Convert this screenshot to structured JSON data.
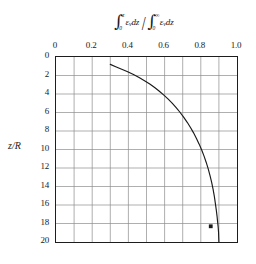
{
  "chart_data": {
    "type": "line",
    "xlabel": "∫₀ᶻ ε_ν dz / ∫₀^∞ ε_ν dz",
    "ylabel": "z/R",
    "xlim": [
      0,
      1.0
    ],
    "ylim": [
      20,
      0
    ],
    "y_inverted": true,
    "grid": true,
    "grid_x_step": 0.1,
    "grid_y_step": 2,
    "xticks": [
      "0",
      "0.2",
      "0.4",
      "0.6",
      "0.8",
      "1.0"
    ],
    "xtick_values": [
      0,
      0.2,
      0.4,
      0.6,
      0.8,
      1.0
    ],
    "xticks_position": "top",
    "yticks": [
      "0",
      "2",
      "4",
      "6",
      "8",
      "10",
      "12",
      "14",
      "16",
      "18",
      "20"
    ],
    "ytick_values": [
      0,
      2,
      4,
      6,
      8,
      10,
      12,
      14,
      16,
      18,
      20
    ],
    "legend": null,
    "series": [
      {
        "name": "cumulative emission fraction",
        "type": "line",
        "color": "#1a1a1a",
        "x": [
          0.3,
          0.33,
          0.363,
          0.396,
          0.428,
          0.459,
          0.489,
          0.518,
          0.545,
          0.571,
          0.596,
          0.62,
          0.643,
          0.665,
          0.686,
          0.706,
          0.725,
          0.743,
          0.76,
          0.776,
          0.791,
          0.805,
          0.818,
          0.83,
          0.841,
          0.851,
          0.86,
          0.868,
          0.875,
          0.881,
          0.886,
          0.89,
          0.893,
          0.896,
          0.898,
          0.899,
          0.9
        ],
        "y": [
          0.8,
          1.05,
          1.32,
          1.6,
          1.9,
          2.22,
          2.56,
          2.92,
          3.3,
          3.7,
          4.12,
          4.56,
          5.02,
          5.5,
          6.0,
          6.52,
          7.06,
          7.62,
          8.2,
          8.8,
          9.42,
          10.06,
          10.72,
          11.4,
          12.1,
          12.82,
          13.56,
          14.32,
          15.1,
          15.9,
          16.6,
          17.25,
          17.85,
          18.4,
          18.95,
          19.5,
          20.0
        ]
      },
      {
        "name": "data point",
        "type": "scatter",
        "marker": "filled-square",
        "color": "#1a1a1a",
        "x": [
          0.855
        ],
        "y": [
          18.3
        ]
      }
    ],
    "annotations": []
  },
  "title_expr": {
    "numerator": {
      "integral_symbol": "∫",
      "upper_limit": "z",
      "lower_limit": "0",
      "integrand": "ε",
      "integrand_subscript": "ν",
      "differential": "dz"
    },
    "divider": "/",
    "denominator": {
      "integral_symbol": "∫",
      "upper_limit": "∞",
      "lower_limit": "0",
      "integrand": "ε",
      "integrand_subscript": "ν",
      "differential": "dz"
    }
  },
  "ylabel_parts": {
    "numerator": "z",
    "slash": "/",
    "denominator": "R"
  },
  "colors": {
    "curve": "#1a1a1a",
    "frame": "#1d1d1d",
    "grid": "#8c8c8c",
    "background": "#ffffff",
    "text": "#1a1a1a"
  }
}
